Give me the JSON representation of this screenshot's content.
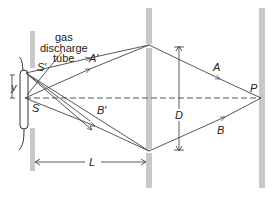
{
  "labels": {
    "source_label": "gas\ndischarge\ntube",
    "source_line1": "gas",
    "source_line2": "discharge",
    "source_line3": "tube",
    "S": "S",
    "S_prime": "S′",
    "A": "A",
    "A_prime": "A′",
    "B": "B",
    "B_prime": "B′",
    "P": "P",
    "D": "D",
    "L": "L",
    "y": "y"
  },
  "colors": {
    "barrier": "#c8c8c8",
    "ray": "#444444",
    "text": "#222222"
  }
}
